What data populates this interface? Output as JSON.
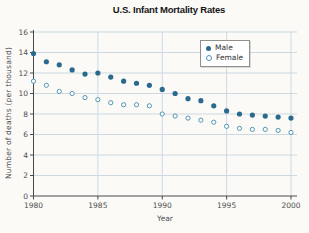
{
  "chart_data": {
    "type": "scatter",
    "title": "U.S. Infant Mortality Rates",
    "xlabel": "Year",
    "ylabel": "Number of deaths (per thousand)",
    "x": [
      1980,
      1981,
      1982,
      1983,
      1984,
      1985,
      1986,
      1987,
      1988,
      1989,
      1990,
      1991,
      1992,
      1993,
      1994,
      1995,
      1996,
      1997,
      1998,
      1999,
      2000
    ],
    "series": [
      {
        "name": "Male",
        "marker": "filled-circle",
        "color": "#2a6a8f",
        "values": [
          13.9,
          13.1,
          12.8,
          12.3,
          11.9,
          12.0,
          11.6,
          11.2,
          11.0,
          10.8,
          10.4,
          10.0,
          9.5,
          9.3,
          8.8,
          8.3,
          8.0,
          7.9,
          7.8,
          7.7,
          7.6
        ]
      },
      {
        "name": "Female",
        "marker": "open-circle",
        "color": "#5095b4",
        "values": [
          11.2,
          10.8,
          10.2,
          10.0,
          9.6,
          9.4,
          9.1,
          8.9,
          8.9,
          8.8,
          8.0,
          7.8,
          7.6,
          7.4,
          7.2,
          6.8,
          6.6,
          6.5,
          6.5,
          6.4,
          6.2
        ]
      }
    ],
    "xlim": [
      1980,
      2000
    ],
    "ylim": [
      0,
      16
    ],
    "xticks": [
      1980,
      1985,
      1990,
      1995,
      2000
    ],
    "yticks": [
      0,
      2,
      4,
      6,
      8,
      10,
      12,
      14,
      16
    ],
    "grid": true,
    "legend_position": "top-right"
  },
  "colors": {
    "background": "#fbfaf6",
    "gridline": "#ccd9e2",
    "axis": "#4a4a4a",
    "tick_label": "#4e4e4e",
    "male": "#2a6a8f",
    "female": "#5095b4"
  }
}
